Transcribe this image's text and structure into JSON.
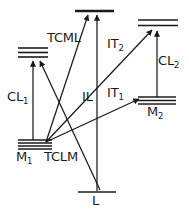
{
  "figure": {
    "type": "energy-level-diagram",
    "background_color": "#ffffff",
    "line_color": "#1a1a1a",
    "width": 189,
    "height": 213
  },
  "levels": [
    {
      "id": "tcml-level",
      "label": "TCML",
      "label_base": "TCML",
      "label_sub": "",
      "sublines": 3,
      "x1": 18,
      "x2": 48,
      "y": 48,
      "line_spacing": 4.5,
      "thick": false
    },
    {
      "id": "m1-level",
      "label": "M1",
      "label_base": "M",
      "label_sub": "1",
      "sublines": 4,
      "x1": 18,
      "x2": 52,
      "y": 140,
      "line_spacing": 3.0,
      "thick": false
    },
    {
      "id": "top-center-level",
      "label": "",
      "label_base": "",
      "label_sub": "",
      "sublines": 1,
      "x1": 75,
      "x2": 114,
      "y": 11,
      "line_spacing": 0,
      "thick": true
    },
    {
      "id": "l-level",
      "label": "L",
      "label_base": "L",
      "label_sub": "",
      "sublines": 1,
      "x1": 78,
      "x2": 116,
      "y": 192,
      "line_spacing": 0,
      "thick": false
    },
    {
      "id": "upper-right-level",
      "label": "",
      "label_base": "",
      "label_sub": "",
      "sublines": 2,
      "x1": 138,
      "x2": 178,
      "y": 20,
      "line_spacing": 5.5,
      "thick": false
    },
    {
      "id": "m2-level",
      "label": "M2",
      "label_base": "M",
      "label_sub": "2",
      "sublines": 3,
      "x1": 138,
      "x2": 176,
      "y": 97,
      "line_spacing": 3.5,
      "thick": false
    }
  ],
  "transitions": [
    {
      "id": "cl1",
      "label_base": "CL",
      "label_sub": "1",
      "from": "m1-level",
      "to": "tcml-level",
      "x1": 33,
      "y1": 140,
      "x2": 33,
      "y2": 60,
      "direction": "up"
    },
    {
      "id": "cl2",
      "label_base": "CL",
      "label_sub": "2",
      "from": "m2-level",
      "to": "upper-right-level",
      "x1": 157,
      "y1": 97,
      "x2": 157,
      "y2": 31,
      "direction": "up"
    },
    {
      "id": "il",
      "label_base": "IL",
      "label_sub": "",
      "from": "l-level",
      "to": "top-center-level",
      "x1": 97,
      "y1": 192,
      "x2": 97,
      "y2": 13,
      "direction": "up"
    },
    {
      "id": "it2",
      "label_base": "IT",
      "label_sub": "2",
      "from": "m1-level",
      "to": "upper-right-level",
      "x1": 46,
      "y1": 143,
      "x2": 152,
      "y2": 30,
      "direction": "up-right"
    },
    {
      "id": "it1",
      "label_base": "IT",
      "label_sub": "1",
      "from": "m1-level",
      "to": "m2-level",
      "x1": 46,
      "y1": 143,
      "x2": 140,
      "y2": 100,
      "direction": "up-right"
    },
    {
      "id": "tclm",
      "label_base": "TCLM",
      "label_sub": "",
      "from": "m1-level",
      "to": "top-center-level",
      "x1": 46,
      "y1": 143,
      "x2": 89,
      "y2": 13,
      "direction": "up-right"
    },
    {
      "id": "tcml-feed",
      "label_base": "",
      "label_sub": "",
      "from": "l-level",
      "to": "tcml-level",
      "x1": 100,
      "y1": 190,
      "x2": 41,
      "y2": 60,
      "direction": "up-left"
    }
  ],
  "labels": {
    "tcml": {
      "text": "TCML",
      "x": 47,
      "y": 38
    },
    "tclm": {
      "text": "TCLM",
      "x": 44,
      "y": 150
    },
    "cl1": {
      "base": "CL",
      "sub": "1",
      "x": 7,
      "y": 91
    },
    "cl2": {
      "base": "CL",
      "sub": "2",
      "x": 158,
      "y": 55
    },
    "il": {
      "base": "IL",
      "sub": "",
      "x": 83,
      "y": 91
    },
    "it1": {
      "base": "IT",
      "sub": "1",
      "x": 107,
      "y": 87
    },
    "it2": {
      "base": "IT",
      "sub": "2",
      "x": 107,
      "y": 38
    },
    "m1": {
      "base": "M",
      "sub": "1",
      "x": 17,
      "y": 150
    },
    "m2": {
      "base": "M",
      "sub": "2",
      "x": 148,
      "y": 105
    },
    "l": {
      "base": "L",
      "sub": "",
      "x": 93,
      "y": 195
    }
  }
}
